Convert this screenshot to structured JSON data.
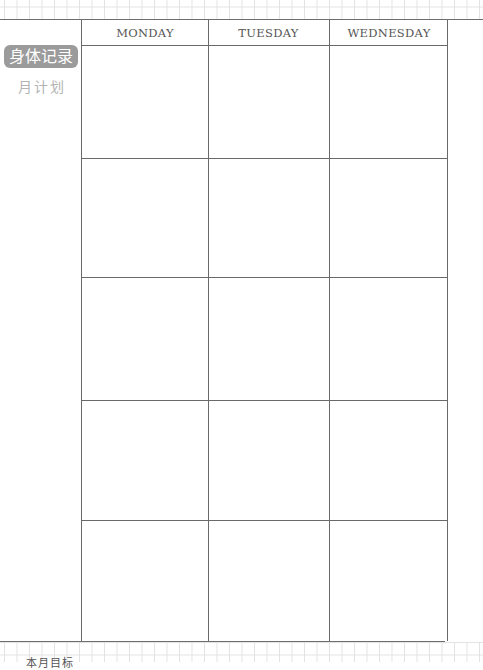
{
  "sidebar": {
    "badge_label": "身体记录",
    "sub_label": "月计划"
  },
  "calendar": {
    "days": [
      "MONDAY",
      "TUESDAY",
      "WEDNESDAY"
    ],
    "week_rows": 5
  },
  "footer": {
    "label": "本月目标"
  },
  "colors": {
    "badge_bg": "#9b9b9b",
    "badge_text": "#ffffff",
    "sub_text": "#b4b4b4",
    "rule": "#6a6a6a",
    "grid": "#e2e2e2"
  }
}
